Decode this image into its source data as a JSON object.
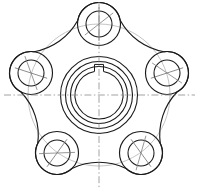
{
  "drawing": {
    "title": "Five-Lobed Flange Hub Plan View",
    "subject": "mechanical-part-orthographic-view",
    "projection": "plan-view",
    "line_colors": {
      "visible_edge": "#1a1a1a",
      "construction": "#b9b9b9",
      "centerline": "#8a8a8a",
      "background": "#ffffff"
    },
    "canvas": {
      "width": 199,
      "height": 190,
      "center_x": 99,
      "center_y": 95
    },
    "hub": {
      "label": "central-hub",
      "center": [
        99,
        95
      ],
      "rings": [
        38.5,
        33.5,
        28.5
      ],
      "bore_radius": 24.0,
      "keyway": {
        "label": "keyway-slot",
        "width": 9,
        "depth": 7,
        "position": "top"
      }
    },
    "bolt_circle": {
      "label": "bolt-circle",
      "radius": 71,
      "count": 5,
      "start_angle_deg": -90
    },
    "bosses": [
      {
        "name": "boss-top",
        "center": [
          99,
          24
        ],
        "outer_radius": 21.5,
        "inner_radius": 13.0,
        "angle_deg": -90
      },
      {
        "name": "boss-right",
        "center": [
          167,
          73
        ],
        "outer_radius": 21.5,
        "inner_radius": 13.0,
        "angle_deg": -18
      },
      {
        "name": "boss-bottom-right",
        "center": [
          141,
          153
        ],
        "outer_radius": 21.5,
        "inner_radius": 13.0,
        "angle_deg": 54
      },
      {
        "name": "boss-bottom-left",
        "center": [
          57,
          153
        ],
        "outer_radius": 21.5,
        "inner_radius": 13.0,
        "angle_deg": 126
      },
      {
        "name": "boss-left",
        "center": [
          31,
          73
        ],
        "outer_radius": 21.5,
        "inner_radius": 13.0,
        "angle_deg": 198
      }
    ],
    "outline": {
      "label": "body-outline",
      "description": "pentagonal body with five concave fillet arcs joining the boss bosses",
      "fillet_radius": 62
    },
    "centerlines": {
      "horizontal": {
        "y": 95,
        "x1": 4,
        "x2": 195
      },
      "vertical": {
        "x": 99,
        "y1": 2,
        "y2": 188
      }
    }
  }
}
